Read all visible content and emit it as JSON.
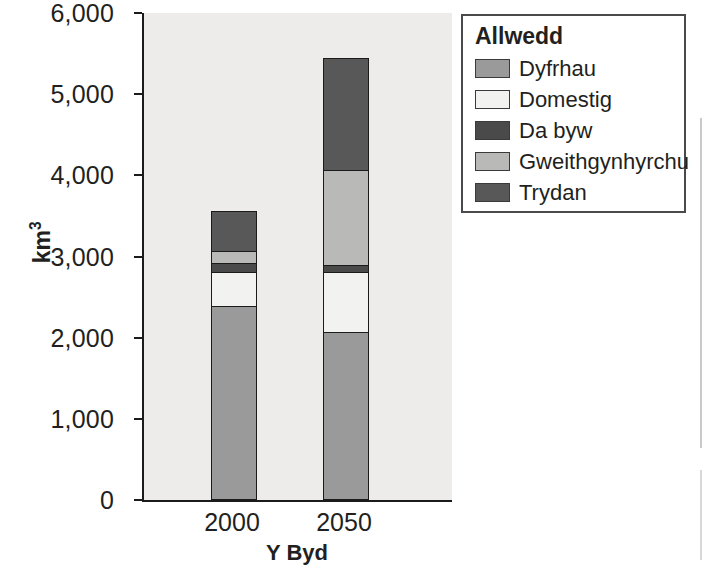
{
  "chart_data": {
    "type": "bar",
    "stacked": true,
    "title": "",
    "xlabel": "Y Byd",
    "ylabel": "km³",
    "categories": [
      "2000",
      "2050"
    ],
    "ylim": [
      0,
      6000
    ],
    "ytick_labels": [
      "0",
      "1,000",
      "2,000",
      "3,000",
      "4,000",
      "5,000",
      "6,000"
    ],
    "ytick_values": [
      0,
      1000,
      2000,
      3000,
      4000,
      5000,
      6000
    ],
    "grid": false,
    "legend_position": "right",
    "legend_title": "Allwedd",
    "series": [
      {
        "name": "Dyfrhau",
        "color": "#9a9a9a",
        "values": [
          2390,
          2070
        ]
      },
      {
        "name": "Domestig",
        "color": "#f2f2f0",
        "values": [
          420,
          740
        ]
      },
      {
        "name": "Da byw",
        "color": "#4a4a4a",
        "values": [
          110,
          85
        ]
      },
      {
        "name": "Gweithgynhyrchu",
        "color": "#b9b9b7",
        "values": [
          145,
          1170
        ]
      },
      {
        "name": "Trydan",
        "color": "#585858",
        "values": [
          495,
          1380
        ]
      }
    ],
    "totals": [
      3560,
      5445
    ],
    "plot_background": "#edeceb",
    "axis_color": "#1b1b1b"
  },
  "ghost": {
    "text": ""
  }
}
